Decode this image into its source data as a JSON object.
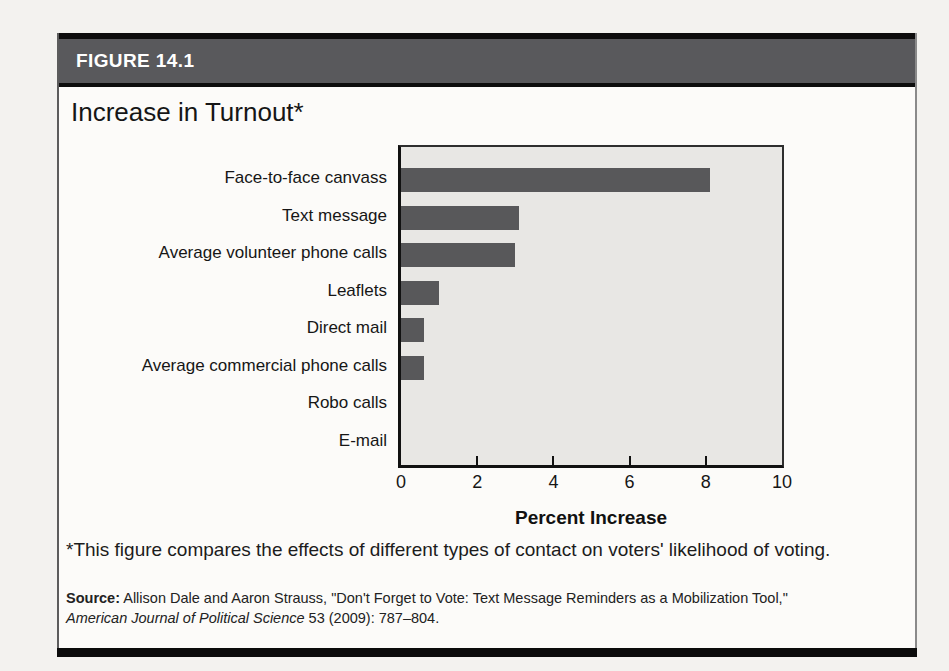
{
  "figure": {
    "label": "FIGURE 14.1",
    "title": "Increase in Turnout*",
    "footnote": "*This figure compares the effects of different types of contact on voters' likelihood of voting.",
    "source": {
      "label": "Source:",
      "before_journal": " Allison Dale and Aaron Strauss, \"Don't Forget to Vote: Text Message Reminders as a Mobilization Tool,\"",
      "journal": "American Journal of Political Science",
      "after_journal": " 53 (2009): 787–804."
    }
  },
  "chart_data": {
    "type": "bar",
    "orientation": "horizontal",
    "title": "Increase in Turnout*",
    "categories": [
      "Face-to-face canvass",
      "Text message",
      "Average volunteer phone calls",
      "Leaflets",
      "Direct mail",
      "Average commercial phone calls",
      "Robo calls",
      "E-mail"
    ],
    "values": [
      8.1,
      3.1,
      3.0,
      1.0,
      0.6,
      0.6,
      0,
      0
    ],
    "xlabel": "Percent Increase",
    "ylabel": "",
    "xlim": [
      0,
      10
    ],
    "xticks": [
      0,
      2,
      4,
      6,
      8,
      10
    ],
    "grid": false,
    "legend": false,
    "bar_color": "#58585a",
    "plot_bg": "#e8e7e4"
  },
  "colors": {
    "header_bg": "#59595c",
    "header_text": "#ffffff",
    "rule_black": "#0d0d0d",
    "page_bg": "#f3f2ef"
  }
}
